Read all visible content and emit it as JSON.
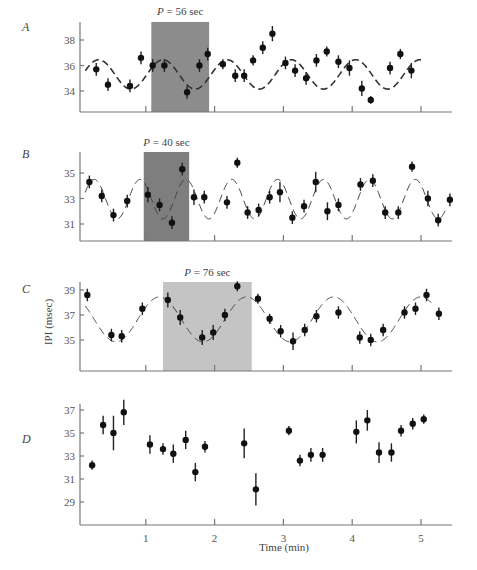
{
  "chart_data": [
    {
      "panel": "A",
      "type": "scatter",
      "xlabel": "Time (min)",
      "ylabel": "IPI (msec)",
      "y_ticks": [
        34,
        36,
        38
      ],
      "ylim": [
        32.8,
        39.2
      ],
      "x_ticks": [
        1,
        2,
        3,
        4,
        5
      ],
      "xlim": [
        0,
        5.5
      ],
      "shaded_window": {
        "label": "P = 56 sec",
        "x_start": 1.08,
        "x_end": 1.92,
        "color": "#8c8c8c"
      },
      "fit": {
        "type": "sinusoid",
        "period_sec": 56,
        "mean": 35.3,
        "amplitude": 1.15,
        "phase_peak_min": 1.25,
        "x_start": 0.12,
        "x_end": 5.05
      },
      "points": [
        {
          "x": 0.28,
          "y": 35.7,
          "err": 0.5
        },
        {
          "x": 0.45,
          "y": 34.5,
          "err": 0.5
        },
        {
          "x": 0.77,
          "y": 34.4,
          "err": 0.5
        },
        {
          "x": 0.93,
          "y": 36.6,
          "err": 0.5
        },
        {
          "x": 1.1,
          "y": 36.0,
          "err": 0.5
        },
        {
          "x": 1.27,
          "y": 36.0,
          "err": 0.5
        },
        {
          "x": 1.6,
          "y": 33.9,
          "err": 0.5
        },
        {
          "x": 1.78,
          "y": 36.0,
          "err": 0.5
        },
        {
          "x": 1.9,
          "y": 36.9,
          "err": 0.5
        },
        {
          "x": 2.12,
          "y": 36.1,
          "err": 0.4
        },
        {
          "x": 2.3,
          "y": 35.2,
          "err": 0.5
        },
        {
          "x": 2.43,
          "y": 35.2,
          "err": 0.5
        },
        {
          "x": 2.56,
          "y": 36.4,
          "err": 0.4
        },
        {
          "x": 2.7,
          "y": 37.4,
          "err": 0.5
        },
        {
          "x": 2.84,
          "y": 38.5,
          "err": 0.6
        },
        {
          "x": 3.03,
          "y": 36.2,
          "err": 0.5
        },
        {
          "x": 3.17,
          "y": 35.6,
          "err": 0.5
        },
        {
          "x": 3.33,
          "y": 35.0,
          "err": 0.5
        },
        {
          "x": 3.48,
          "y": 36.4,
          "err": 0.5
        },
        {
          "x": 3.63,
          "y": 37.1,
          "err": 0.4
        },
        {
          "x": 3.8,
          "y": 36.3,
          "err": 0.5
        },
        {
          "x": 3.96,
          "y": 35.8,
          "err": 0.6
        },
        {
          "x": 4.14,
          "y": 34.2,
          "err": 0.6
        },
        {
          "x": 4.27,
          "y": 33.3,
          "err": 0.3
        },
        {
          "x": 4.55,
          "y": 35.8,
          "err": 0.5
        },
        {
          "x": 4.7,
          "y": 36.9,
          "err": 0.4
        },
        {
          "x": 4.86,
          "y": 35.6,
          "err": 0.6
        }
      ]
    },
    {
      "panel": "B",
      "type": "scatter",
      "xlabel": "Time (min)",
      "ylabel": "IPI (msec)",
      "y_ticks": [
        31,
        33,
        35
      ],
      "ylim": [
        29.8,
        36.6
      ],
      "x_ticks": [
        1,
        2,
        3,
        4,
        5
      ],
      "xlim": [
        0,
        5.5
      ],
      "shaded_window": {
        "label": "P = 40 sec",
        "x_start": 0.97,
        "x_end": 1.63,
        "color": "#7e7e7e"
      },
      "fit": {
        "type": "sinusoid",
        "period_sec": 40,
        "mean": 32.95,
        "amplitude": 1.55,
        "phase_peak_min": 0.25,
        "x_start": 0.12,
        "x_end": 5.36
      },
      "points": [
        {
          "x": 0.18,
          "y": 34.3,
          "err": 0.5
        },
        {
          "x": 0.36,
          "y": 33.2,
          "err": 0.5
        },
        {
          "x": 0.53,
          "y": 31.7,
          "err": 0.5
        },
        {
          "x": 0.73,
          "y": 32.8,
          "err": 0.5
        },
        {
          "x": 1.03,
          "y": 33.3,
          "err": 0.6
        },
        {
          "x": 1.2,
          "y": 32.5,
          "err": 0.5
        },
        {
          "x": 1.38,
          "y": 31.1,
          "err": 0.5
        },
        {
          "x": 1.53,
          "y": 35.3,
          "err": 0.5
        },
        {
          "x": 1.7,
          "y": 33.1,
          "err": 0.6
        },
        {
          "x": 1.85,
          "y": 33.1,
          "err": 0.5
        },
        {
          "x": 2.18,
          "y": 32.7,
          "err": 0.5
        },
        {
          "x": 2.33,
          "y": 35.8,
          "err": 0.4
        },
        {
          "x": 2.48,
          "y": 31.9,
          "err": 0.5
        },
        {
          "x": 2.64,
          "y": 32.1,
          "err": 0.5
        },
        {
          "x": 2.8,
          "y": 33.1,
          "err": 0.5
        },
        {
          "x": 2.95,
          "y": 33.5,
          "err": 0.8
        },
        {
          "x": 3.13,
          "y": 31.5,
          "err": 0.5
        },
        {
          "x": 3.3,
          "y": 32.4,
          "err": 0.5
        },
        {
          "x": 3.47,
          "y": 34.3,
          "err": 0.8
        },
        {
          "x": 3.64,
          "y": 32.0,
          "err": 0.7
        },
        {
          "x": 3.8,
          "y": 32.5,
          "err": 0.5
        },
        {
          "x": 4.12,
          "y": 34.1,
          "err": 0.5
        },
        {
          "x": 4.3,
          "y": 34.4,
          "err": 0.5
        },
        {
          "x": 4.48,
          "y": 31.9,
          "err": 0.5
        },
        {
          "x": 4.67,
          "y": 31.9,
          "err": 0.5
        },
        {
          "x": 4.87,
          "y": 35.5,
          "err": 0.4
        },
        {
          "x": 5.1,
          "y": 33.0,
          "err": 0.6
        },
        {
          "x": 5.25,
          "y": 31.3,
          "err": 0.5
        },
        {
          "x": 5.42,
          "y": 32.9,
          "err": 0.5
        }
      ]
    },
    {
      "panel": "C",
      "type": "scatter",
      "xlabel": "Time (min)",
      "ylabel": "IPI (msec)",
      "y_ticks": [
        35,
        37,
        39
      ],
      "ylim": [
        32.6,
        39.6
      ],
      "x_ticks": [
        1,
        2,
        3,
        4,
        5
      ],
      "xlim": [
        0,
        5.5
      ],
      "shaded_window": {
        "label": "P = 76 sec",
        "x_start": 1.25,
        "x_end": 2.54,
        "color": "#c4c4c4"
      },
      "fit": {
        "type": "sinusoid",
        "period_sec": 76,
        "mean": 36.65,
        "amplitude": 1.8,
        "phase_peak_min": 1.2,
        "x_start": 0.12,
        "x_end": 5.18
      },
      "points": [
        {
          "x": 0.15,
          "y": 38.6,
          "err": 0.5
        },
        {
          "x": 0.5,
          "y": 35.4,
          "err": 0.5
        },
        {
          "x": 0.65,
          "y": 35.3,
          "err": 0.5
        },
        {
          "x": 0.95,
          "y": 37.5,
          "err": 0.5
        },
        {
          "x": 1.32,
          "y": 38.2,
          "err": 0.6
        },
        {
          "x": 1.5,
          "y": 36.8,
          "err": 0.6
        },
        {
          "x": 1.82,
          "y": 35.2,
          "err": 0.6
        },
        {
          "x": 1.98,
          "y": 35.6,
          "err": 0.6
        },
        {
          "x": 2.15,
          "y": 37.0,
          "err": 0.5
        },
        {
          "x": 2.33,
          "y": 39.3,
          "err": 0.4
        },
        {
          "x": 2.63,
          "y": 38.3,
          "err": 0.4
        },
        {
          "x": 2.8,
          "y": 36.7,
          "err": 0.4
        },
        {
          "x": 2.96,
          "y": 35.7,
          "err": 0.5
        },
        {
          "x": 3.14,
          "y": 34.9,
          "err": 0.7
        },
        {
          "x": 3.31,
          "y": 35.8,
          "err": 0.5
        },
        {
          "x": 3.48,
          "y": 36.9,
          "err": 0.5
        },
        {
          "x": 3.8,
          "y": 37.2,
          "err": 0.5
        },
        {
          "x": 4.11,
          "y": 35.2,
          "err": 0.5
        },
        {
          "x": 4.27,
          "y": 35.0,
          "err": 0.5
        },
        {
          "x": 4.45,
          "y": 35.8,
          "err": 0.5
        },
        {
          "x": 4.76,
          "y": 37.2,
          "err": 0.5
        },
        {
          "x": 4.92,
          "y": 37.5,
          "err": 0.5
        },
        {
          "x": 5.08,
          "y": 38.6,
          "err": 0.5
        },
        {
          "x": 5.26,
          "y": 37.1,
          "err": 0.5
        }
      ]
    },
    {
      "panel": "D",
      "type": "scatter",
      "xlabel": "Time (min)",
      "ylabel": "IPI (msec)",
      "y_ticks": [
        29,
        31,
        33,
        35,
        37
      ],
      "ylim": [
        27.0,
        37.7
      ],
      "x_ticks": [
        1,
        2,
        3,
        4,
        5
      ],
      "xlim": [
        0,
        5.5
      ],
      "points": [
        {
          "x": 0.22,
          "y": 32.2,
          "err": 0.4
        },
        {
          "x": 0.38,
          "y": 35.7,
          "err": 0.8
        },
        {
          "x": 0.53,
          "y": 35.0,
          "err": 1.5
        },
        {
          "x": 0.68,
          "y": 36.8,
          "err": 1.1
        },
        {
          "x": 1.06,
          "y": 34.0,
          "err": 0.8
        },
        {
          "x": 1.25,
          "y": 33.6,
          "err": 0.5
        },
        {
          "x": 1.4,
          "y": 33.2,
          "err": 0.8
        },
        {
          "x": 1.58,
          "y": 34.4,
          "err": 0.8
        },
        {
          "x": 1.72,
          "y": 31.6,
          "err": 0.8
        },
        {
          "x": 1.86,
          "y": 33.8,
          "err": 0.5
        },
        {
          "x": 2.43,
          "y": 34.1,
          "err": 1.3
        },
        {
          "x": 2.6,
          "y": 30.1,
          "err": 1.4
        },
        {
          "x": 3.08,
          "y": 35.2,
          "err": 0.4
        },
        {
          "x": 3.24,
          "y": 32.6,
          "err": 0.5
        },
        {
          "x": 3.4,
          "y": 33.1,
          "err": 0.6
        },
        {
          "x": 3.57,
          "y": 33.1,
          "err": 0.6
        },
        {
          "x": 4.06,
          "y": 35.1,
          "err": 1.0
        },
        {
          "x": 4.22,
          "y": 36.1,
          "err": 0.9
        },
        {
          "x": 4.39,
          "y": 33.3,
          "err": 0.9
        },
        {
          "x": 4.57,
          "y": 33.3,
          "err": 0.8
        },
        {
          "x": 4.71,
          "y": 35.2,
          "err": 0.5
        },
        {
          "x": 4.88,
          "y": 35.8,
          "err": 0.5
        },
        {
          "x": 5.04,
          "y": 36.2,
          "err": 0.4
        }
      ]
    }
  ],
  "labels": {
    "panel_a": "A",
    "panel_b": "B",
    "panel_c": "C",
    "panel_d": "D",
    "y_axis_title": "IPI (msec)",
    "x_axis_title": "Time (min)",
    "x_tick_labels": [
      "1",
      "2",
      "3",
      "4",
      "5"
    ]
  }
}
